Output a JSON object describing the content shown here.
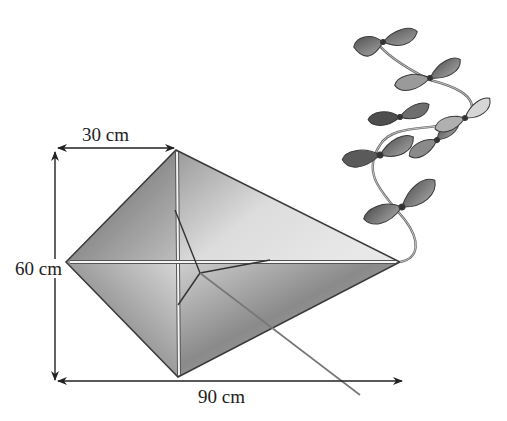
{
  "diagram": {
    "labels": {
      "top_width": "30 cm",
      "height": "60 cm",
      "total_length": "90 cm"
    },
    "colors": {
      "outline": "#3a3a3a",
      "sail_dark": "#6e6e6e",
      "sail_light": "#d8d8d8",
      "spar": "#f2f2f2",
      "bow_dark": "#5a5a5a",
      "bow_light": "#9a9a9a",
      "arrow": "#222222"
    },
    "tail_bows": 6
  }
}
